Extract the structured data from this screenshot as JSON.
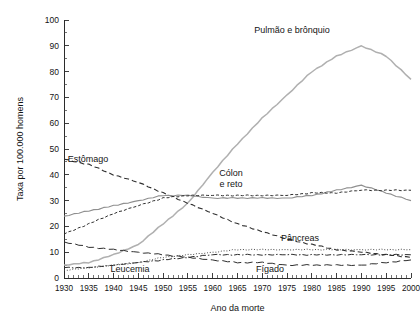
{
  "chart_data": {
    "type": "line",
    "title": "",
    "xlabel": "Ano da morte",
    "ylabel": "Taxa por 100.000 homens",
    "xlim": [
      1930,
      2000
    ],
    "ylim": [
      0,
      100
    ],
    "grid": false,
    "legend_position": "inline-annotations",
    "x_ticks": [
      "1930",
      "1935",
      "1940",
      "1945",
      "1950",
      "1955",
      "1960",
      "1965",
      "1970",
      "1975",
      "1980",
      "1985",
      "1990",
      "1995",
      "2000"
    ],
    "y_ticks": [
      "0",
      "10",
      "20",
      "30",
      "40",
      "50",
      "60",
      "70",
      "80",
      "90",
      "100"
    ],
    "x": [
      1930,
      1935,
      1940,
      1945,
      1950,
      1955,
      1960,
      1965,
      1970,
      1975,
      1980,
      1985,
      1990,
      1995,
      2000
    ],
    "series": [
      {
        "name": "Pulmão e brônquio",
        "label": "Pulmão e brônquio",
        "color": "#b0b0b0",
        "style": "solid",
        "width": 1.5,
        "values": [
          5,
          6,
          9,
          13,
          21,
          29,
          41,
          52,
          62,
          71,
          80,
          86,
          90,
          86,
          77
        ]
      },
      {
        "name": "Estômago",
        "label": "Estômago",
        "color": "#2e2e2e",
        "style": "dashed",
        "width": 1.1,
        "values": [
          46,
          44,
          40,
          37,
          33,
          29,
          25,
          21,
          18,
          15,
          13,
          11,
          10,
          9,
          8
        ]
      },
      {
        "name": "Cólon e reto",
        "label": "Cólon e reto",
        "color": "#8f8f8f",
        "style": "solid",
        "width": 1.1,
        "values": [
          24,
          26,
          28,
          30,
          32,
          32,
          31,
          31,
          31,
          31,
          32,
          34,
          36,
          33,
          30
        ]
      },
      {
        "name": "Próstata",
        "label": "",
        "color": "#2e2e2e",
        "style": "fine-dashed",
        "width": 1.0,
        "values": [
          17,
          21,
          25,
          28,
          31,
          32,
          32,
          32,
          32,
          32,
          33,
          33,
          34,
          34,
          34
        ]
      },
      {
        "name": "Pâncreas",
        "label": "Pâncreas",
        "color": "#4a4a4a",
        "style": "dotted",
        "width": 1.0,
        "values": [
          3,
          4,
          5,
          6,
          8,
          9,
          10,
          11,
          11,
          11,
          11,
          11,
          11,
          11,
          11
        ]
      },
      {
        "name": "Leucemia",
        "label": "Leucemia",
        "color": "#2e2e2e",
        "style": "dash-dot",
        "width": 1.0,
        "values": [
          4,
          4,
          5,
          6,
          7,
          8,
          9,
          9,
          9,
          9,
          9,
          9,
          9,
          9,
          9
        ]
      },
      {
        "name": "Fígado",
        "label": "Fígado",
        "color": "#2e2e2e",
        "style": "long-dash",
        "width": 1.0,
        "values": [
          14,
          12,
          11,
          10,
          9,
          8,
          7,
          6,
          6,
          5,
          5,
          5,
          5,
          6,
          7
        ]
      }
    ],
    "annotations": [
      {
        "text": "Pulmão e brônquio",
        "x_px": 292,
        "y_px": 33,
        "lines": [
          "Pulmão e brônquio"
        ]
      },
      {
        "text": "Estômago",
        "x_px": 88,
        "y_px": 162,
        "lines": [
          "Estômago"
        ]
      },
      {
        "text": "Cólon e reto",
        "x_px": 231,
        "y_px": 176,
        "lines": [
          "Cólon",
          "e reto"
        ]
      },
      {
        "text": "Pâncreas",
        "x_px": 300,
        "y_px": 241,
        "lines": [
          "Pâncreas"
        ]
      },
      {
        "text": "Leucemia",
        "x_px": 130,
        "y_px": 272,
        "lines": [
          "Leucemia"
        ]
      },
      {
        "text": "Fígado",
        "x_px": 270,
        "y_px": 272,
        "lines": [
          "Fígado"
        ]
      }
    ]
  },
  "figure": {
    "background_color": "#ffffff",
    "axis_color": "#2b2b2b"
  }
}
